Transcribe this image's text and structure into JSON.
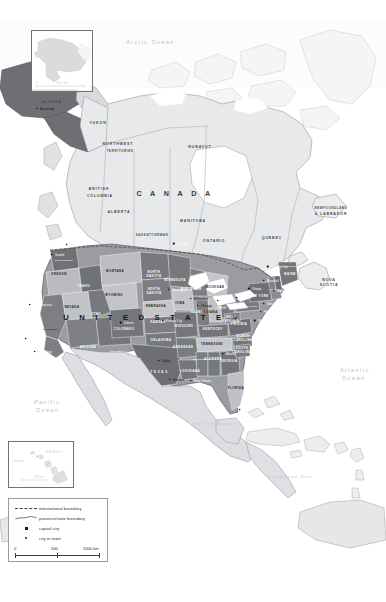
{
  "map": {
    "title": "North America political map",
    "oceans": [
      {
        "name": "Arctic Ocean",
        "x": 126,
        "y": 44
      },
      {
        "name": "Pacific Ocean",
        "x": 34,
        "y": 404
      },
      {
        "name": "Atlantic Ocean",
        "x": 340,
        "y": 372
      },
      {
        "name": "Gulf of Mexico",
        "x": 193,
        "y": 425
      },
      {
        "name": "Caribbean Sea",
        "x": 268,
        "y": 478
      }
    ],
    "countries": [
      {
        "name": "C A N A D A",
        "x": 175,
        "y": 196
      },
      {
        "name": "U N I T E D   S T A T E S",
        "x": 152,
        "y": 320
      }
    ],
    "provinces": [
      {
        "name": "YUKON",
        "x": 98,
        "y": 124
      },
      {
        "name": "NORTHWEST",
        "x": 118,
        "y": 145
      },
      {
        "name": "TERRITORIES",
        "x": 120,
        "y": 152
      },
      {
        "name": "NUNAVUT",
        "x": 200,
        "y": 148
      },
      {
        "name": "BRITISH",
        "x": 99,
        "y": 190
      },
      {
        "name": "COLUMBIA",
        "x": 100,
        "y": 197
      },
      {
        "name": "ALBERTA",
        "x": 119,
        "y": 213
      },
      {
        "name": "SASKATCHEWAN",
        "x": 152,
        "y": 236
      },
      {
        "name": "MANITOBA",
        "x": 193,
        "y": 222
      },
      {
        "name": "ONTARIO",
        "x": 214,
        "y": 242
      },
      {
        "name": "QUEBEC",
        "x": 272,
        "y": 239
      },
      {
        "name": "NEWFOUNDLAND",
        "x": 331,
        "y": 209
      },
      {
        "name": "& LABRADOR",
        "x": 331,
        "y": 215
      },
      {
        "name": "NOVA",
        "x": 329,
        "y": 281
      },
      {
        "name": "SCOTIA",
        "x": 329,
        "y": 286
      },
      {
        "name": "ALASKA",
        "x": 52,
        "y": 103
      }
    ],
    "states": [
      {
        "name": "WASHINGTON",
        "x": 64,
        "y": 261,
        "light": false
      },
      {
        "name": "OREGON",
        "x": 59,
        "y": 275,
        "light": true
      },
      {
        "name": "IDAHO",
        "x": 84,
        "y": 287,
        "light": false
      },
      {
        "name": "MONTANA",
        "x": 115,
        "y": 272,
        "light": true
      },
      {
        "name": "NORTH",
        "x": 154,
        "y": 273,
        "light": false
      },
      {
        "name": "DAKOTA",
        "x": 154,
        "y": 277,
        "light": false
      },
      {
        "name": "SOUTH",
        "x": 154,
        "y": 290,
        "light": false
      },
      {
        "name": "DAKOTA",
        "x": 154,
        "y": 294,
        "light": false
      },
      {
        "name": "WYOMING",
        "x": 114,
        "y": 296,
        "light": true
      },
      {
        "name": "NEBRASKA",
        "x": 156,
        "y": 307,
        "light": true
      },
      {
        "name": "NEVADA",
        "x": 72,
        "y": 308,
        "light": true
      },
      {
        "name": "UTAH",
        "x": 96,
        "y": 315,
        "light": false
      },
      {
        "name": "COLORADO",
        "x": 124,
        "y": 330,
        "light": false
      },
      {
        "name": "KANSAS",
        "x": 158,
        "y": 323,
        "light": false
      },
      {
        "name": "CALIFORNIA",
        "x": 51,
        "y": 330,
        "light": true
      },
      {
        "name": "ARIZONA",
        "x": 88,
        "y": 348,
        "light": false
      },
      {
        "name": "NEW MEXICO",
        "x": 119,
        "y": 352,
        "light": false
      },
      {
        "name": "OKLAHOMA",
        "x": 161,
        "y": 341,
        "light": false
      },
      {
        "name": "T E X A S",
        "x": 159,
        "y": 373,
        "light": false
      },
      {
        "name": "MINNESOTA",
        "x": 175,
        "y": 281,
        "light": false
      },
      {
        "name": "WISCONSIN",
        "x": 191,
        "y": 290,
        "light": false
      },
      {
        "name": "IOWA",
        "x": 180,
        "y": 304,
        "light": true
      },
      {
        "name": "MISSOURI",
        "x": 184,
        "y": 327,
        "light": false
      },
      {
        "name": "ILLINOIS",
        "x": 199,
        "y": 313,
        "light": false
      },
      {
        "name": "MICHIGAN",
        "x": 215,
        "y": 288,
        "light": true
      },
      {
        "name": "INDIANA",
        "x": 210,
        "y": 313,
        "light": true
      },
      {
        "name": "OHIO",
        "x": 222,
        "y": 309,
        "light": false
      },
      {
        "name": "KENTUCKY",
        "x": 213,
        "y": 330,
        "light": false
      },
      {
        "name": "TENNESSEE",
        "x": 212,
        "y": 345,
        "light": true
      },
      {
        "name": "ARKANSAS",
        "x": 183,
        "y": 348,
        "light": false
      },
      {
        "name": "LOUISIANA",
        "x": 190,
        "y": 372,
        "light": false
      },
      {
        "name": "MISSISSIPPI",
        "x": 201,
        "y": 360,
        "light": false
      },
      {
        "name": "ALABAMA",
        "x": 213,
        "y": 360,
        "light": false
      },
      {
        "name": "GEORGIA",
        "x": 229,
        "y": 362,
        "light": false
      },
      {
        "name": "FLORIDA",
        "x": 236,
        "y": 389,
        "light": true
      },
      {
        "name": "SOUTH",
        "x": 242,
        "y": 349,
        "light": false
      },
      {
        "name": "CAROLINA",
        "x": 242,
        "y": 353,
        "light": false
      },
      {
        "name": "NORTH",
        "x": 243,
        "y": 337,
        "light": false
      },
      {
        "name": "CAROLINA",
        "x": 243,
        "y": 341,
        "light": false
      },
      {
        "name": "VIRGINIA",
        "x": 239,
        "y": 325,
        "light": false
      },
      {
        "name": "WEST",
        "x": 231,
        "y": 318,
        "light": false
      },
      {
        "name": "VIRGINIA",
        "x": 231,
        "y": 322,
        "light": false
      },
      {
        "name": "PENNSYLVANIA",
        "x": 248,
        "y": 307,
        "light": false
      },
      {
        "name": "NEW YORK",
        "x": 259,
        "y": 297,
        "light": false
      },
      {
        "name": "MAINE",
        "x": 290,
        "y": 275,
        "light": false
      },
      {
        "name": "VERMONT",
        "x": 272,
        "y": 271,
        "light": false
      },
      {
        "name": "NEW HAMPSHIRE",
        "x": 288,
        "y": 267,
        "light": false
      }
    ],
    "cities": [
      {
        "name": "Anchorage",
        "x": 40,
        "y": 110,
        "capital": false,
        "light": true
      },
      {
        "name": "Vancouver",
        "x": 70,
        "y": 246,
        "capital": false,
        "light": false
      },
      {
        "name": "Winnipeg",
        "x": 177,
        "y": 245,
        "capital": true,
        "light": false
      },
      {
        "name": "Quebec City",
        "x": 271,
        "y": 268,
        "capital": true,
        "light": false
      },
      {
        "name": "Montreal",
        "x": 267,
        "y": 282,
        "capital": false,
        "light": false
      },
      {
        "name": "Ottawa",
        "x": 252,
        "y": 290,
        "capital": true,
        "light": false
      },
      {
        "name": "Toronto",
        "x": 240,
        "y": 299,
        "capital": false,
        "light": false
      },
      {
        "name": "Minneapolis",
        "x": 172,
        "y": 291,
        "capital": false,
        "light": false
      },
      {
        "name": "Milwaukee",
        "x": 194,
        "y": 300,
        "capital": false,
        "light": true
      },
      {
        "name": "Chicago",
        "x": 201,
        "y": 307,
        "capital": false,
        "light": true
      },
      {
        "name": "Detroit",
        "x": 221,
        "y": 302,
        "capital": false,
        "light": false
      },
      {
        "name": "Boston",
        "x": 277,
        "y": 292,
        "capital": false,
        "light": false
      },
      {
        "name": "New York",
        "x": 267,
        "y": 305,
        "capital": false,
        "light": false
      },
      {
        "name": "Philadelphia",
        "x": 264,
        "y": 313,
        "capital": false,
        "light": false
      },
      {
        "name": "Washington",
        "x": 258,
        "y": 322,
        "capital": true,
        "light": false
      },
      {
        "name": "Kansas City",
        "x": 166,
        "y": 322,
        "capital": false,
        "light": false
      },
      {
        "name": "Atlanta",
        "x": 226,
        "y": 355,
        "capital": false,
        "light": false
      },
      {
        "name": "Dallas",
        "x": 162,
        "y": 362,
        "capital": false,
        "light": true
      },
      {
        "name": "Houston",
        "x": 173,
        "y": 381,
        "capital": false,
        "light": true
      },
      {
        "name": "New Orleans",
        "x": 194,
        "y": 382,
        "capital": false,
        "light": false
      },
      {
        "name": "Miami",
        "x": 243,
        "y": 411,
        "capital": false,
        "light": false
      },
      {
        "name": "Denver",
        "x": 124,
        "y": 324,
        "capital": true,
        "light": false
      },
      {
        "name": "San Francisco",
        "x": 33,
        "y": 306,
        "capital": false,
        "light": false
      },
      {
        "name": "Los Angeles",
        "x": 29,
        "y": 340,
        "capital": false,
        "light": false
      },
      {
        "name": "San Diego",
        "x": 38,
        "y": 353,
        "capital": false,
        "light": false
      },
      {
        "name": "Seattle",
        "x": 55,
        "y": 256,
        "capital": false,
        "light": false
      }
    ],
    "insets": [
      {
        "id": "alaska",
        "region_label": "ALASKA",
        "scale_zero": "0",
        "scale_max": "1000 km"
      },
      {
        "id": "hawaii",
        "region_label": "HAWAII",
        "city_label": "Honolulu",
        "scale_max": "250 km"
      }
    ]
  },
  "legend": {
    "items": [
      {
        "symbol": "dashed-line",
        "label": "international boundary"
      },
      {
        "symbol": "solid-line",
        "label": "province/state boundary"
      },
      {
        "symbol": "square-marker",
        "label": "capital city"
      },
      {
        "symbol": "dot-marker",
        "label": "city or town"
      }
    ],
    "scale": {
      "ticks": [
        "0",
        "500",
        "1000 km"
      ]
    }
  },
  "colors": {
    "us_dark": "#6d6f74",
    "us_light": "#b9bbc0",
    "canada": "#e6e7e9",
    "mexico": "#dcdde0",
    "water": "#ffffff",
    "boundary": "#4a4b4e"
  }
}
